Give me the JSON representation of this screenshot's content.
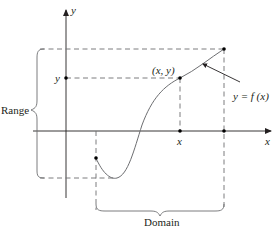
{
  "diagram": {
    "axes": {
      "x_label": "x",
      "y_label": "y"
    },
    "labels": {
      "point": "(x, y)",
      "y_tick": "y",
      "x_tick": "x",
      "function": "y = f (x)",
      "range": "Range",
      "domain": "Domain"
    },
    "colors": {
      "ink": "#231f20",
      "gray": "#6d6e71"
    }
  }
}
